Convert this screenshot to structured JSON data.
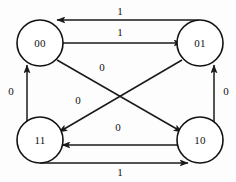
{
  "diagram": {
    "type": "state-transition-diagram",
    "background_color": "#fdfdfd",
    "line_color": "#1a1a1a",
    "node_fill_color": "#ffffff",
    "nodes": [
      {
        "id": "s00",
        "label": "00",
        "cx": 40,
        "cy": 43,
        "r": 23
      },
      {
        "id": "s01",
        "label": "01",
        "cx": 200,
        "cy": 43,
        "r": 23
      },
      {
        "id": "s11",
        "label": "11",
        "cx": 40,
        "cy": 140,
        "r": 23
      },
      {
        "id": "s10",
        "label": "10",
        "cx": 200,
        "cy": 140,
        "r": 23
      }
    ],
    "edges": [
      {
        "id": "e-01-to-00",
        "from": "01",
        "to": "00",
        "label": "1",
        "label_x": 120,
        "label_y": 12
      },
      {
        "id": "e-00-to-01",
        "from": "00",
        "to": "01",
        "label": "1",
        "label_x": 120,
        "label_y": 33
      },
      {
        "id": "e-11-to-00",
        "from": "11",
        "to": "00",
        "label": "0",
        "label_x": 11,
        "label_y": 92
      },
      {
        "id": "e-10-to-01",
        "from": "10",
        "to": "01",
        "label": "0",
        "label_x": 226,
        "label_y": 92
      },
      {
        "id": "e-00-to-10",
        "from": "00",
        "to": "10",
        "label": "0",
        "label_x": 102,
        "label_y": 68
      },
      {
        "id": "e-01-to-11",
        "from": "01",
        "to": "11",
        "label": "0",
        "label_x": 78,
        "label_y": 101
      },
      {
        "id": "e-10-to-11",
        "from": "10",
        "to": "11",
        "label": "0",
        "label_x": 118,
        "label_y": 128
      },
      {
        "id": "e-11-to-10",
        "from": "11",
        "to": "10",
        "label": "1",
        "label_x": 120,
        "label_y": 172
      }
    ]
  }
}
